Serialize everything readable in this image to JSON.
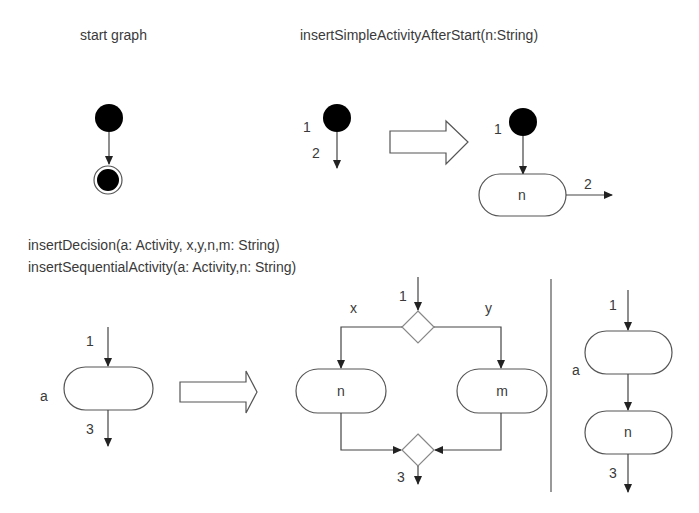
{
  "panels": {
    "start_graph": {
      "title": "start graph"
    },
    "insert_simple": {
      "title": "insertSimpleActivityAfterStart(n:String)",
      "before": {
        "label_in": "1",
        "label_out": "2"
      },
      "after": {
        "label_in": "1",
        "activity": "n",
        "label_out": "2"
      }
    },
    "section2": {
      "title_line1": "insertDecision(a: Activity, x,y,n,m: String)",
      "title_line2": "insertSequentialActivity(a: Activity,n: String)",
      "before": {
        "label_in": "1",
        "activity_name": "a",
        "label_out": "3"
      },
      "decision": {
        "label_in": "1",
        "branch_left_guard": "x",
        "branch_right_guard": "y",
        "left_activity": "n",
        "right_activity": "m",
        "label_out": "3"
      },
      "sequential": {
        "label_in": "1",
        "activity_name": "a",
        "second_activity": "n",
        "label_out": "3"
      }
    }
  },
  "colors": {
    "line": "#444444",
    "node_fill": "#000000",
    "background": "#ffffff"
  }
}
